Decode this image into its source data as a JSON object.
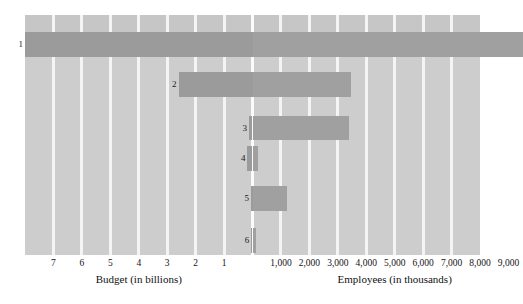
{
  "chart_data": {
    "type": "bar",
    "orientation": "horizontal-diverging",
    "title": "",
    "subtitle": "",
    "grid": true,
    "legend": null,
    "categories": [
      "1",
      "2",
      "3",
      "4",
      "5",
      "6"
    ],
    "axes": {
      "left": {
        "label": "Budget (in billions)",
        "ticks": [
          "7",
          "6",
          "5",
          "4",
          "3",
          "2",
          "1"
        ],
        "tick_values": [
          7,
          6,
          5,
          4,
          3,
          2,
          1
        ],
        "direction": "right-to-left",
        "range": [
          0,
          8
        ]
      },
      "right": {
        "label": "Employees (in thousands)",
        "ticks": [
          "1,000",
          "2,000",
          "3,000",
          "4,000",
          "5,000",
          "6,000",
          "7,000",
          "8,000",
          "9,000"
        ],
        "tick_values": [
          1000,
          2000,
          3000,
          4000,
          5000,
          6000,
          7000,
          8000,
          9000
        ],
        "direction": "left-to-right",
        "range": [
          0,
          9500
        ]
      }
    },
    "series": [
      {
        "name": "Budget (in billions)",
        "values": [
          8.0,
          2.6,
          0.12,
          0.18,
          0.05,
          0.04
        ]
      },
      {
        "name": "Employees (in thousands)",
        "values": [
          9500,
          3450,
          3400,
          180,
          1230,
          110
        ]
      }
    ],
    "rows": [
      {
        "label": "1",
        "budget": 8.0,
        "employees": 9500
      },
      {
        "label": "2",
        "budget": 2.6,
        "employees": 3450
      },
      {
        "label": "3",
        "budget": 0.12,
        "employees": 3400
      },
      {
        "label": "4",
        "budget": 0.18,
        "employees": 180
      },
      {
        "label": "5",
        "budget": 0.05,
        "employees": 1230
      },
      {
        "label": "6",
        "budget": 0.04,
        "employees": 110
      }
    ]
  },
  "colors": {
    "panel_background": "#cdcdcd",
    "panel_top_band": "#c6c6c6",
    "bar_fill": "#999999",
    "gridline": "#f4f4f4",
    "text": "#141414",
    "page_background": "#ffffff"
  },
  "labels": {
    "budget_caption": "Budget (in billions)",
    "employees_caption": "Employees (in thousands)",
    "budget_ticks": [
      "7",
      "6",
      "5",
      "4",
      "3",
      "2",
      "1"
    ],
    "employees_ticks": [
      "1,000",
      "2,000",
      "3,000",
      "4,000",
      "5,000",
      "6,000",
      "7,000",
      "8,000",
      "9,000"
    ],
    "row_numbers": [
      "1",
      "2",
      "3",
      "4",
      "5",
      "6"
    ]
  }
}
